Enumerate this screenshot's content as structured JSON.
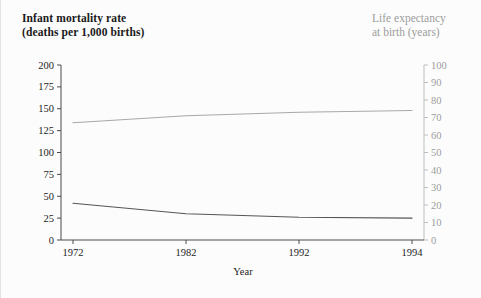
{
  "figure": {
    "background": "#fcfcfc",
    "left_axis_color": "#1c1c1c",
    "right_axis_color": "#9c9c9c"
  },
  "titles": {
    "left": "Infant mortality rate\n(deaths per 1,000 births)",
    "right": "Life expectancy\nat birth (years)"
  },
  "chart_data": {
    "type": "line",
    "title": "",
    "xlabel": "Year",
    "grid": false,
    "legend": "none",
    "x": [
      1972,
      1982,
      1992,
      1994
    ],
    "x_tick_labels": [
      "1972",
      "1982",
      "1992",
      "1994"
    ],
    "xlim": [
      1972,
      1994
    ],
    "axes": [
      {
        "id": "left",
        "ylabel": "Infant mortality rate (deaths per 1,000 births)",
        "ylim": [
          0,
          200
        ],
        "ytick_step": 25,
        "yticks": [
          0,
          25,
          50,
          75,
          100,
          125,
          150,
          175,
          200
        ],
        "ytick_labels": [
          "0",
          "25",
          "50",
          "75",
          "100",
          "125",
          "150",
          "175",
          "200"
        ],
        "color": "#1c1c1c"
      },
      {
        "id": "right",
        "ylabel": "Life expectancy at birth (years)",
        "ylim": [
          0,
          100
        ],
        "ytick_step": 10,
        "yticks": [
          0,
          10,
          20,
          30,
          40,
          50,
          60,
          70,
          80,
          90,
          100
        ],
        "ytick_labels": [
          "0",
          "10",
          "20",
          "30",
          "40",
          "50",
          "60",
          "70",
          "80",
          "90",
          "100"
        ],
        "color": "#9c9c9c"
      }
    ],
    "series": [
      {
        "name": "Infant mortality rate",
        "axis": "left",
        "color": "#555555",
        "units": "deaths per 1,000 births",
        "values": [
          42,
          30,
          26,
          25
        ]
      },
      {
        "name": "Life expectancy at birth",
        "axis": "right",
        "color": "#a8a8a8",
        "units": "years",
        "values": [
          67,
          71,
          73,
          74
        ]
      }
    ]
  }
}
